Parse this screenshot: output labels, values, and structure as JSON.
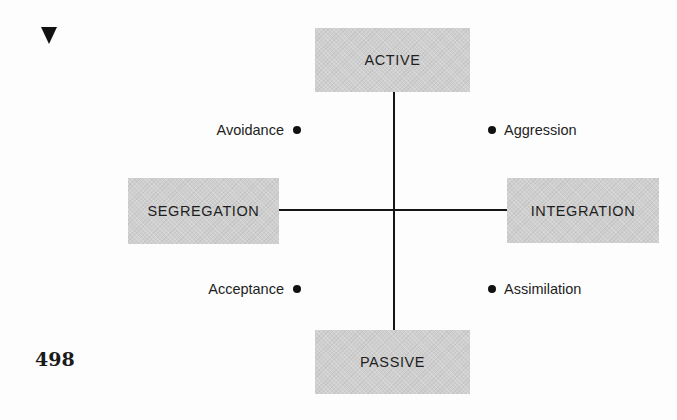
{
  "page": {
    "page_number": "498",
    "marker_icon": "down-triangle-icon"
  },
  "diagram": {
    "axes": {
      "vertical": {
        "top": "ACTIVE",
        "bottom": "PASSIVE"
      },
      "horizontal": {
        "left": "SEGREGATION",
        "right": "INTEGRATION"
      }
    },
    "quadrants": {
      "top_left": "Avoidance",
      "top_right": "Aggression",
      "bottom_left": "Acceptance",
      "bottom_right": "Assimilation"
    },
    "colors": {
      "box_fill": "#cfcfcf",
      "line": "#151515",
      "text": "#1e1e1e"
    }
  }
}
